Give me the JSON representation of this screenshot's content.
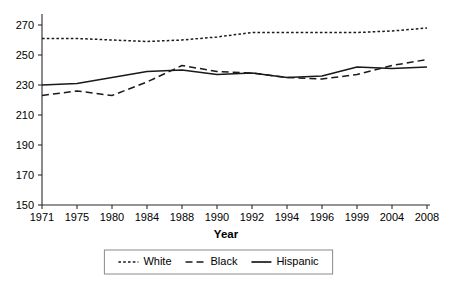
{
  "chart_data": {
    "type": "line",
    "title": "",
    "xlabel": "Year",
    "ylabel": "",
    "categories": [
      "1971",
      "1975",
      "1980",
      "1984",
      "1988",
      "1990",
      "1992",
      "1994",
      "1996",
      "1999",
      "2004",
      "2008"
    ],
    "yticks": [
      150,
      170,
      190,
      210,
      230,
      250,
      270
    ],
    "ylim": [
      150,
      276
    ],
    "grid": false,
    "legend_position": "bottom-center",
    "series": [
      {
        "name": "White",
        "style": "dotted",
        "color": "#1a1a1a",
        "values": [
          261,
          261,
          260,
          259,
          260,
          262,
          265,
          265,
          265,
          265,
          266,
          268
        ]
      },
      {
        "name": "Black",
        "style": "dashed",
        "color": "#1a1a1a",
        "values": [
          223,
          226,
          223,
          232,
          243,
          239,
          238,
          235,
          234,
          237,
          243,
          247
        ]
      },
      {
        "name": "Hispanic",
        "style": "solid",
        "color": "#1a1a1a",
        "values": [
          230,
          231,
          235,
          239,
          240,
          237,
          238,
          235,
          236,
          242,
          241,
          242
        ]
      }
    ]
  },
  "legend": {
    "items": [
      {
        "label": "White",
        "style": "dotted"
      },
      {
        "label": "Black",
        "style": "dashed"
      },
      {
        "label": "Hispanic",
        "style": "solid"
      }
    ]
  },
  "axis": {
    "x_title": "Year"
  }
}
